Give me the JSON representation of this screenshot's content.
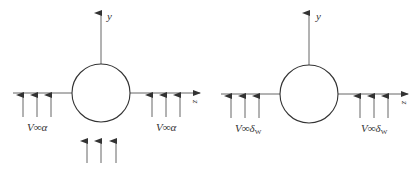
{
  "figure": {
    "left_panel": {
      "axis_y_label": "y",
      "axis_z_label": "z",
      "left_label": "V∞α",
      "right_label": "V∞α",
      "has_bottom_arrows": true
    },
    "right_panel": {
      "axis_y_label": "y",
      "axis_z_label": "z",
      "left_label_main": "V∞δ",
      "left_label_sub": "W",
      "right_label_main": "V∞δ",
      "right_label_sub": "W",
      "has_bottom_arrows": false
    },
    "colors": {
      "stroke": "#444444",
      "background": "#ffffff"
    }
  }
}
